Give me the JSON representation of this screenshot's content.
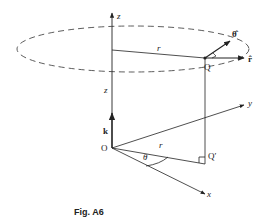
{
  "figure": {
    "caption": "Fig. A6",
    "colors": {
      "line": "#222222",
      "background": "#ffffff"
    }
  },
  "labels": {
    "z_axis": "z",
    "z_height": "z",
    "r_top": "r",
    "r_bottom": "r",
    "theta_hat": "θ̂",
    "r_hat": "r̂",
    "Q": "Q",
    "Q_prime": "Q′",
    "O": "O",
    "k": "k",
    "y_axis": "y",
    "x_axis": "x",
    "theta": "θ"
  }
}
